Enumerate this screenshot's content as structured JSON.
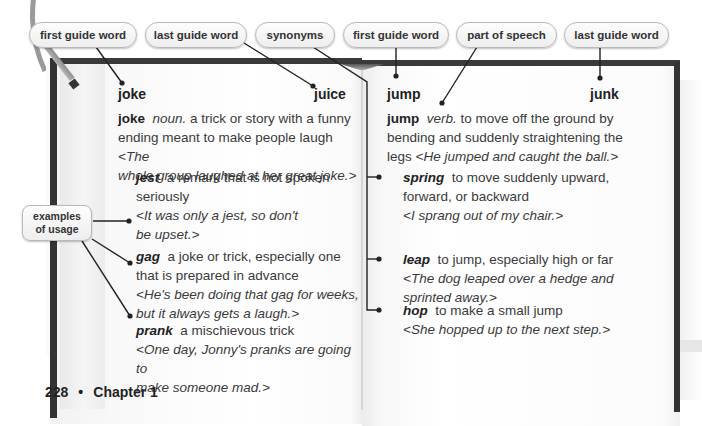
{
  "callouts": {
    "left_first_guide": "first guide word",
    "left_last_guide": "last guide word",
    "synonyms": "synonyms",
    "right_first_guide": "first guide word",
    "part_of_speech": "part of speech",
    "right_last_guide": "last guide word",
    "examples_line1": "examples",
    "examples_line2": "of usage"
  },
  "left_page": {
    "first_guide_word": "joke",
    "last_guide_word": "juice",
    "main_entry": {
      "headword": "joke",
      "part_of_speech": "noun.",
      "definition_line1": "a trick or story with a funny",
      "definition_line2": "ending meant to make people laugh",
      "example_start": "<The",
      "example_line2": "whole group laughed at her great joke.>"
    },
    "synonyms": [
      {
        "word": "jest",
        "def_line1": "a remark that is not spoken",
        "def_line2": "seriously",
        "ex_line1": "<It was only a jest, so don't",
        "ex_line2": "be upset.>"
      },
      {
        "word": "gag",
        "def_line1": "a joke or trick, especially one",
        "def_line2": "that is prepared in advance",
        "ex_line1": "<He's been doing that gag for weeks,",
        "ex_line2": "but it always gets a laugh.>"
      },
      {
        "word": "prank",
        "def_line1": "a mischievous trick",
        "ex_line1": "<One day, Jonny's pranks are going to",
        "ex_line2": "make someone mad.>"
      }
    ]
  },
  "right_page": {
    "first_guide_word": "jump",
    "last_guide_word": "junk",
    "main_entry": {
      "headword": "jump",
      "part_of_speech": "verb.",
      "definition_line1": "to move off the ground by",
      "definition_line2": "bending and suddenly straightening the",
      "definition_line3": "legs",
      "example": "<He jumped and caught the ball.>"
    },
    "synonyms": [
      {
        "word": "spring",
        "def_line1": "to move suddenly upward,",
        "def_line2": "forward, or backward",
        "ex_line1": "<I sprang out of my chair.>"
      },
      {
        "word": "leap",
        "def_line1": "to jump, especially high or far",
        "ex_line1": "<The dog leaped over a hedge and",
        "ex_line2": "sprinted away.>"
      },
      {
        "word": "hop",
        "def_line1": "to make a small jump",
        "ex_line1": "<She hopped up to the next step.>"
      }
    ]
  },
  "footer": {
    "page_number": "228",
    "separator": "•",
    "chapter": "Chapter 1"
  }
}
